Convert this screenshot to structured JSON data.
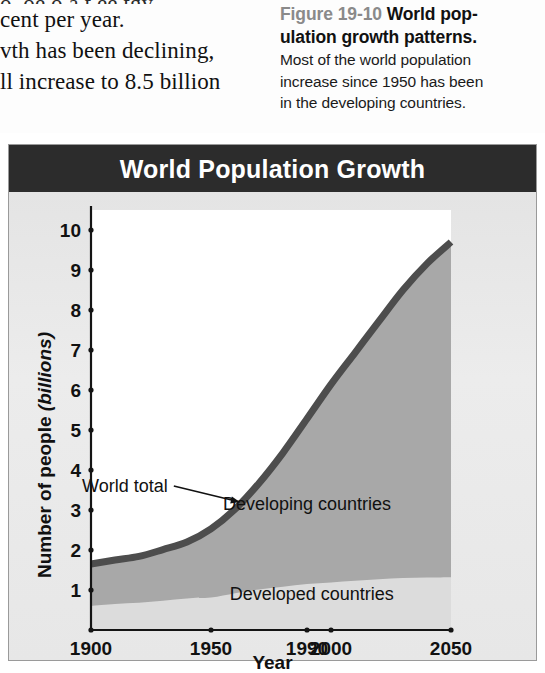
{
  "page_text": {
    "body_lines": [
      "o, oe o.a.t ee.tgy",
      "cent per year.",
      "vth has been declining,",
      "ll increase to 8.5 billion"
    ]
  },
  "caption": {
    "figure_number": "Figure 19-10",
    "title_line1": "World pop-",
    "title_line2": "ulation growth patterns.",
    "body_lines": [
      "Most of the world population",
      "increase since 1950 has been",
      "in the developing countries."
    ]
  },
  "figure": {
    "header_title": "World Population Growth",
    "header_bg": "#2c2c2c",
    "header_fg": "#ffffff",
    "card_bg": "#e9e9e9",
    "plot_bg": "#ffffff"
  },
  "chart_data": {
    "type": "area",
    "title": "World Population Growth",
    "xlabel": "Year",
    "ylabel": "Number of people (billions)",
    "ylabel_main": "Number of people ",
    "ylabel_unit": "(billions)",
    "xlim": [
      1900,
      2050
    ],
    "ylim": [
      0,
      10.5
    ],
    "grid": false,
    "legend": "in-plot annotations",
    "x_ticks": [
      1900,
      1950,
      1990,
      2000,
      2050
    ],
    "x_tick_labels": [
      "1900",
      "1950",
      "1990",
      "2000",
      "2050"
    ],
    "y_ticks": [
      1,
      2,
      3,
      4,
      5,
      6,
      7,
      8,
      9,
      10
    ],
    "y_tick_labels": [
      "1",
      "2",
      "3",
      "4",
      "5",
      "6",
      "7",
      "8",
      "9",
      "10"
    ],
    "stacked": true,
    "colors": {
      "world_total_line": "#4d4d4d",
      "developing_fill": "#a8a8a8",
      "developed_fill": "#dcdcdc",
      "axis": "#1a1a1a"
    },
    "x": [
      1900,
      1910,
      1920,
      1930,
      1940,
      1950,
      1960,
      1970,
      1980,
      1990,
      2000,
      2010,
      2020,
      2030,
      2040,
      2050
    ],
    "series": [
      {
        "name": "Developed countries",
        "label": "Developed countries",
        "values": [
          0.6,
          0.65,
          0.68,
          0.73,
          0.79,
          0.81,
          0.92,
          1.01,
          1.08,
          1.15,
          1.19,
          1.23,
          1.27,
          1.3,
          1.31,
          1.32
        ]
      },
      {
        "name": "Developing countries",
        "label": "Developing countries",
        "values": [
          1.05,
          1.1,
          1.16,
          1.28,
          1.41,
          1.72,
          2.1,
          2.66,
          3.35,
          4.13,
          4.95,
          5.7,
          6.45,
          7.2,
          7.85,
          8.38
        ]
      }
    ],
    "total": {
      "name": "World total",
      "label": "World total",
      "values": [
        1.65,
        1.75,
        1.84,
        2.01,
        2.2,
        2.53,
        3.02,
        3.67,
        4.43,
        5.28,
        6.14,
        6.93,
        7.72,
        8.5,
        9.16,
        9.7
      ]
    },
    "annotations": [
      {
        "text": "World total",
        "x": 1932,
        "y": 3.6,
        "leader_to_x": 1962,
        "leader_to_y": 3.2
      },
      {
        "text": "Developing countries",
        "x": 1990,
        "y": 3.0
      },
      {
        "text": "Developed countries",
        "x": 1992,
        "y": 0.75
      }
    ]
  }
}
